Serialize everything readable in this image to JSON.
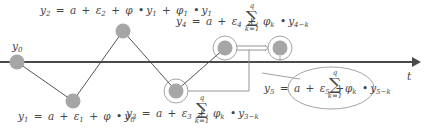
{
  "diagram": {
    "axis_label": "t",
    "nodes": [
      {
        "id": "y0",
        "label": "y0",
        "x": 17,
        "y": 62,
        "ringed": false
      },
      {
        "id": "y1",
        "label": "y1",
        "x": 73,
        "y": 101,
        "ringed": false
      },
      {
        "id": "y2",
        "label": "y2",
        "x": 123,
        "y": 31,
        "ringed": false
      },
      {
        "id": "y3",
        "label": "y3",
        "x": 176,
        "y": 91,
        "ringed": true
      },
      {
        "id": "y4",
        "label": "y4",
        "x": 225,
        "y": 48,
        "ringed": true
      },
      {
        "id": "y5",
        "label": "y5",
        "x": 280,
        "y": 48,
        "ringed": true
      }
    ],
    "colors": {
      "node_fill": "#a6a6a6",
      "axis": "#4a4a4a",
      "line": "#555555",
      "ring": "#9a9a9a"
    },
    "equations": {
      "y0": {
        "lhs": "y",
        "lhs_sub": "0"
      },
      "y1": {
        "lhs": "y",
        "lhs_sub": "1",
        "eq": "=",
        "a": "a",
        "plus1": "+",
        "eps": "ε",
        "eps_sub": "1",
        "plus2": "+",
        "phi": "φ",
        "dot": "•",
        "y": "y",
        "y_sub": "0"
      },
      "y2": {
        "lhs": "y",
        "lhs_sub": "2",
        "eq": "=",
        "a": "a",
        "plus1": "+",
        "eps": "ε",
        "eps_sub": "2",
        "plus2": "+",
        "phi": "φ",
        "dot": "•",
        "y": "y",
        "y_sub": "1",
        "plus3": "+",
        "phi1": "φ",
        "phi1_sub": "1",
        "dot2": "•",
        "y2": "y",
        "y2_sub": "1"
      },
      "y3": {
        "lhs": "y",
        "lhs_sub": "3",
        "eq": "=",
        "a": "a",
        "plus1": "+",
        "eps": "ε",
        "eps_sub": "3",
        "plus2": "+",
        "sum_sym": "∑",
        "sum_top": "q",
        "sum_bottom": "k=1",
        "phi": "φ",
        "phi_sub": "k",
        "dot": "•",
        "y": "y",
        "y_sub": "3−k"
      },
      "y4": {
        "lhs": "y",
        "lhs_sub": "4",
        "eq": "=",
        "a": "a",
        "plus1": "+",
        "eps": "ε",
        "eps_sub": "4",
        "plus2": "+",
        "sum_sym": "∑",
        "sum_top": "q",
        "sum_bottom": "k=1",
        "phi": "φ",
        "phi_sub": "k",
        "dot": "•",
        "y": "y",
        "y_sub": "4−k"
      },
      "y5": {
        "lhs": "y",
        "lhs_sub": "5",
        "eq": "=",
        "a": "a",
        "plus1": "+",
        "eps": "ε",
        "eps_sub": "5",
        "plus2": "+",
        "sum_sym": "∑",
        "sum_top": "q",
        "sum_bottom": "k=1",
        "phi": "φ",
        "phi_sub": "k",
        "dot": "•",
        "y": "y",
        "y_sub": "5−k"
      }
    }
  }
}
